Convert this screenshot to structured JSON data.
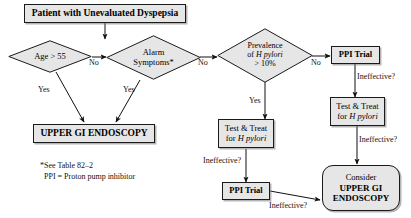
{
  "diagram": {
    "title_box": {
      "label": "Patient with Unevaluated Dyspepsia"
    },
    "decisions": {
      "age": {
        "label": "Age > 55"
      },
      "alarm_line1": "Alarm",
      "alarm_line2": "Symptoms*",
      "prevalence_line1": "Prevalence",
      "prevalence_line2_pre": "of ",
      "prevalence_line2_ital": "H pylori",
      "prevalence_line3": "> 10%"
    },
    "boxes": {
      "endoscopy": {
        "label": "UPPER GI ENDOSCOPY"
      },
      "ppi_trial_top": {
        "label": "PPI Trial"
      },
      "ppi_trial_bottom": {
        "label": "PPI Trial"
      },
      "test_treat_left_line1": "Test & Treat",
      "test_treat_left_line2_pre": "for ",
      "test_treat_left_line2_ital": "H pylori",
      "test_treat_right_line1": "Test & Treat",
      "test_treat_right_line2_pre": "for ",
      "test_treat_right_line2_ital": "H pylori",
      "consider_line1": "Consider",
      "consider_line2": "UPPER GI",
      "consider_line3": "ENDOSCOPY"
    },
    "edge_labels": {
      "age_no": "No",
      "age_yes": "Yes",
      "alarm_no": "No",
      "alarm_yes": "Yes",
      "prevalence_no": "No",
      "prevalence_yes": "Yes",
      "ineffective_top_right": "Ineffective?",
      "ineffective_mid_right": "Ineffective?",
      "ineffective_left": "Ineffective?",
      "ineffective_bottom": "Ineffective?"
    },
    "footnotes": {
      "line1": "*See Table 82–2",
      "line2": "PPI = Proton pump inhibitor"
    },
    "colors": {
      "node_fill": "#e6e6e6",
      "node_stroke": "#1a1a1a",
      "background": "#ffffff",
      "text": "#111111"
    }
  }
}
